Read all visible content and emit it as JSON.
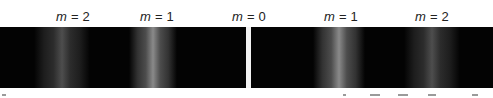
{
  "figure": {
    "labels": [
      {
        "id": "left-m2",
        "var": "m",
        "text": " = 2",
        "x": 73
      },
      {
        "id": "left-m1",
        "var": "m",
        "text": " = 1",
        "x": 157
      },
      {
        "id": "center-m0",
        "var": "m",
        "text": " = 0",
        "x": 249
      },
      {
        "id": "right-m1",
        "var": "m",
        "text": " = 1",
        "x": 341
      },
      {
        "id": "right-m2",
        "var": "m",
        "text": " = 2",
        "x": 432
      }
    ],
    "band": {
      "background": "#030303"
    },
    "central_maximum": {
      "x": 246,
      "width": 5,
      "color": "#f2f2f2"
    },
    "fringes": [
      {
        "order": "m2-left",
        "center": 62,
        "halfwidth": 28,
        "peak": 0.32
      },
      {
        "order": "m1-left",
        "center": 153,
        "halfwidth": 24,
        "peak": 0.58
      },
      {
        "order": "m1-right",
        "center": 339,
        "halfwidth": 26,
        "peak": 0.58
      },
      {
        "order": "m2-right",
        "center": 432,
        "halfwidth": 28,
        "peak": 0.32
      }
    ]
  }
}
